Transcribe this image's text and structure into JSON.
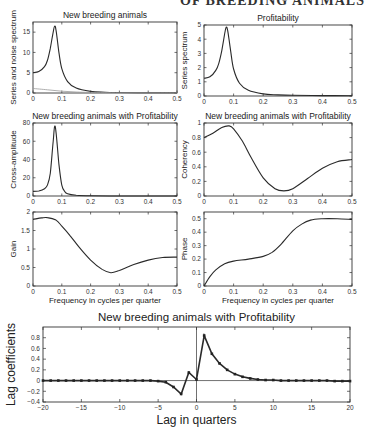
{
  "header_clipped_text": "OF BREEDING ANIMALS",
  "chart_data": [
    {
      "type": "line",
      "id": "p1",
      "title": "New breeding animals",
      "xlabel": "",
      "ylabel": "Series and noise spectrum",
      "xlim": [
        0,
        0.5
      ],
      "ylim": [
        0,
        17.5
      ],
      "xticks": [
        0,
        0.1,
        0.2,
        0.3,
        0.4,
        0.5
      ],
      "yticks": [
        0,
        5,
        10,
        15
      ],
      "series": [
        {
          "name": "Series spectrum",
          "x": [
            0,
            0.02,
            0.04,
            0.05,
            0.06,
            0.07,
            0.075,
            0.08,
            0.09,
            0.1,
            0.12,
            0.15,
            0.2,
            0.25,
            0.3,
            0.4,
            0.5
          ],
          "y": [
            5,
            5.3,
            6.5,
            8,
            11,
            15,
            16.5,
            15.5,
            10,
            6,
            2.8,
            1.2,
            0.4,
            0.2,
            0.12,
            0.06,
            0.05
          ]
        },
        {
          "name": "Noise spectrum",
          "x": [
            0,
            0.05,
            0.1,
            0.15,
            0.2,
            0.3,
            0.4,
            0.5
          ],
          "y": [
            1.1,
            0.8,
            0.45,
            0.25,
            0.15,
            0.08,
            0.05,
            0.04
          ]
        }
      ]
    },
    {
      "type": "line",
      "id": "p2",
      "title": "Profitability",
      "xlabel": "",
      "ylabel": "Series spectrum",
      "xlim": [
        0,
        0.5
      ],
      "ylim": [
        0,
        5
      ],
      "xticks": [
        0,
        0.1,
        0.2,
        0.3,
        0.4,
        0.5
      ],
      "yticks": [
        0,
        1,
        2,
        3,
        4,
        5
      ],
      "series": [
        {
          "name": "Series spectrum",
          "x": [
            0,
            0.02,
            0.04,
            0.05,
            0.06,
            0.07,
            0.075,
            0.08,
            0.09,
            0.1,
            0.12,
            0.15,
            0.2,
            0.25,
            0.3,
            0.4,
            0.5
          ],
          "y": [
            1.25,
            1.35,
            1.8,
            2.3,
            3.2,
            4.4,
            4.85,
            4.6,
            3.2,
            1.9,
            0.9,
            0.4,
            0.15,
            0.08,
            0.05,
            0.03,
            0.02
          ]
        }
      ]
    },
    {
      "type": "line",
      "id": "p3",
      "title": "New breeding animals with Profitability",
      "xlabel": "",
      "ylabel": "Cross-amplitude",
      "xlim": [
        0,
        0.5
      ],
      "ylim": [
        0,
        80
      ],
      "xticks": [
        0,
        0.1,
        0.2,
        0.3,
        0.4,
        0.5
      ],
      "yticks": [
        0,
        20,
        40,
        60,
        80
      ],
      "series": [
        {
          "name": "Cross-amplitude",
          "x": [
            0,
            0.02,
            0.04,
            0.05,
            0.06,
            0.07,
            0.075,
            0.08,
            0.09,
            0.1,
            0.11,
            0.12,
            0.15,
            0.2,
            0.3,
            0.4,
            0.5
          ],
          "y": [
            5,
            5.5,
            8,
            12,
            25,
            60,
            76,
            70,
            35,
            12,
            5,
            2.5,
            0.8,
            0.2,
            0.05,
            0.02,
            0.01
          ]
        }
      ]
    },
    {
      "type": "line",
      "id": "p4",
      "title": "New breeding animals with Profitability",
      "xlabel": "",
      "ylabel": "Coherency",
      "xlim": [
        0,
        0.5
      ],
      "ylim": [
        0,
        1
      ],
      "xticks": [
        0,
        0.1,
        0.2,
        0.3,
        0.4,
        0.5
      ],
      "yticks": [
        0,
        0.2,
        0.4,
        0.6,
        0.8,
        1
      ],
      "series": [
        {
          "name": "Coherency",
          "x": [
            0,
            0.03,
            0.06,
            0.085,
            0.1,
            0.13,
            0.16,
            0.2,
            0.24,
            0.27,
            0.3,
            0.35,
            0.4,
            0.45,
            0.5
          ],
          "y": [
            0.8,
            0.86,
            0.94,
            0.96,
            0.92,
            0.75,
            0.52,
            0.25,
            0.1,
            0.07,
            0.1,
            0.24,
            0.38,
            0.47,
            0.5
          ]
        }
      ]
    },
    {
      "type": "line",
      "id": "p5",
      "title": "",
      "xlabel": "Frequency in cycles per quarter",
      "ylabel": "Gain",
      "xlim": [
        0,
        0.5
      ],
      "ylim": [
        0,
        2
      ],
      "xticks": [
        0,
        0.1,
        0.2,
        0.3,
        0.4,
        0.5
      ],
      "yticks": [
        0,
        0.5,
        1,
        1.5,
        2
      ],
      "series": [
        {
          "name": "Gain",
          "x": [
            0,
            0.03,
            0.05,
            0.08,
            0.1,
            0.13,
            0.16,
            0.2,
            0.24,
            0.27,
            0.3,
            0.35,
            0.4,
            0.45,
            0.5
          ],
          "y": [
            1.8,
            1.84,
            1.85,
            1.78,
            1.62,
            1.35,
            1.05,
            0.7,
            0.45,
            0.36,
            0.42,
            0.58,
            0.7,
            0.77,
            0.78
          ]
        }
      ]
    },
    {
      "type": "line",
      "id": "p6",
      "title": "",
      "xlabel": "Frequency in cycles per quarter",
      "ylabel": "Phase",
      "xlim": [
        0,
        0.5
      ],
      "ylim": [
        0,
        0.55
      ],
      "xticks": [
        0,
        0.1,
        0.2,
        0.3,
        0.4,
        0.5
      ],
      "yticks": [
        0,
        0.1,
        0.2,
        0.3,
        0.4,
        0.5
      ],
      "series": [
        {
          "name": "Phase",
          "x": [
            0,
            0.02,
            0.04,
            0.07,
            0.1,
            0.15,
            0.2,
            0.23,
            0.26,
            0.3,
            0.33,
            0.36,
            0.4,
            0.45,
            0.5
          ],
          "y": [
            0,
            0.07,
            0.12,
            0.165,
            0.185,
            0.2,
            0.22,
            0.25,
            0.31,
            0.41,
            0.46,
            0.49,
            0.5,
            0.5,
            0.495
          ]
        }
      ]
    },
    {
      "type": "line",
      "id": "p7",
      "title": "New breeding animals with Profitability",
      "xlabel": "Lag in quarters",
      "ylabel": "Lag coefficients",
      "xlim": [
        -20,
        20
      ],
      "ylim": [
        -0.4,
        1.0
      ],
      "xticks": [
        -20,
        -15,
        -10,
        -5,
        0,
        5,
        10,
        15,
        20
      ],
      "yticks": [
        -0.4,
        -0.2,
        0,
        0.2,
        0.4,
        0.6,
        0.8
      ],
      "markers": true,
      "series": [
        {
          "name": "Lag coefficients",
          "x": [
            -20,
            -19,
            -18,
            -17,
            -16,
            -15,
            -14,
            -13,
            -12,
            -11,
            -10,
            -9,
            -8,
            -7,
            -6,
            -5,
            -4,
            -3,
            -2,
            -1,
            0,
            1,
            2,
            3,
            4,
            5,
            6,
            7,
            8,
            9,
            10,
            11,
            12,
            13,
            14,
            15,
            16,
            17,
            18,
            19,
            20
          ],
          "y": [
            0,
            0,
            0,
            0,
            0,
            0,
            0,
            0,
            0,
            0,
            0,
            0,
            0,
            0,
            0,
            -0.01,
            -0.03,
            -0.12,
            -0.25,
            0.15,
            0.02,
            0.84,
            0.5,
            0.32,
            0.2,
            0.12,
            0.07,
            0.04,
            0.02,
            0.01,
            0.01,
            0,
            0,
            0,
            0,
            0,
            0,
            0,
            -0.01,
            -0.01,
            -0.01
          ]
        }
      ]
    }
  ]
}
